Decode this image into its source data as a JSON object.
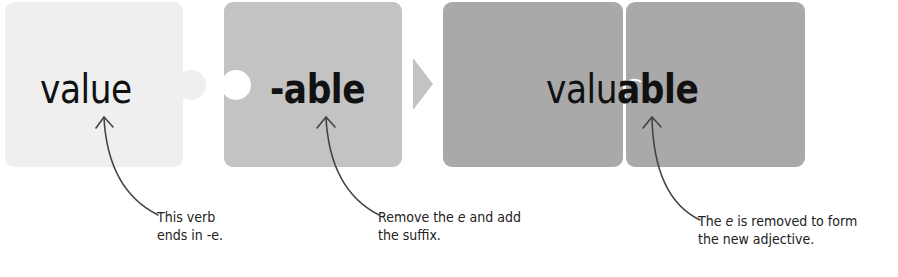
{
  "diagram": {
    "colors": {
      "tile_light": "#efefef",
      "tile_mid": "#c3c3c3",
      "tile_dark": "#a9a9a9",
      "text": "#111111",
      "connector": "#444444"
    },
    "tiles": [
      {
        "id": "root",
        "word": "value",
        "weight": "regular"
      },
      {
        "id": "suffix",
        "word": "-able",
        "weight": "bold"
      },
      {
        "id": "result",
        "word_regular_part": "valu",
        "word_bold_part": "able",
        "full_word": "valuable"
      }
    ],
    "arrow": {
      "icon": "triangle-right-icon"
    },
    "annotations": [
      {
        "target": "root",
        "line1": "This verb",
        "line2": "ends in -e."
      },
      {
        "target": "suffix",
        "line1_pre": "Remove the ",
        "line1_em": "e",
        "line1_post": " and add",
        "line2": "the suffix."
      },
      {
        "target": "result",
        "line1_pre": "The ",
        "line1_em": "e",
        "line1_post": " is removed to form",
        "line2": "the new adjective."
      }
    ]
  }
}
